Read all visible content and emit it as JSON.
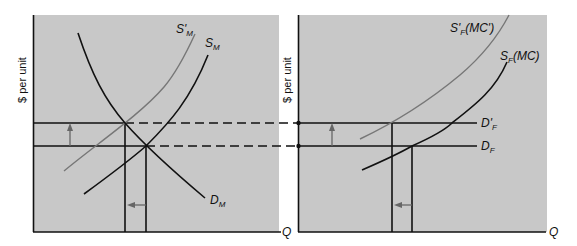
{
  "left_panel": {
    "y_axis_label": "$ per unit",
    "x_axis_label": "Q",
    "curves": {
      "supply_shifted": {
        "main": "S'",
        "sub": "M"
      },
      "supply": {
        "main": "S",
        "sub": "M"
      },
      "demand": {
        "main": "D",
        "sub": "M"
      }
    }
  },
  "right_panel": {
    "y_axis_label": "$ per unit",
    "x_axis_label": "Q",
    "curves": {
      "supply_shifted": {
        "main": "S'",
        "sub": "F",
        "suffix": "(MC')"
      },
      "supply": {
        "main": "S",
        "sub": "F",
        "suffix": "(MC)"
      },
      "demand_shifted": {
        "main": "D'",
        "sub": "F"
      },
      "demand": {
        "main": "D",
        "sub": "F"
      }
    }
  },
  "colors": {
    "panel_bg": "#c8c8c8",
    "line": "#111111",
    "shifted_curve": "#777777",
    "arrow": "#666666"
  }
}
